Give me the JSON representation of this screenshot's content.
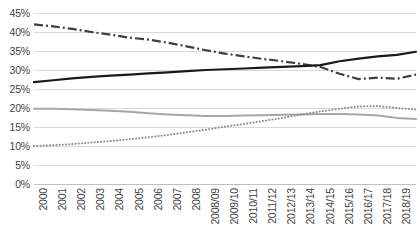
{
  "chart_data": {
    "type": "line",
    "title": "",
    "subtitle": "",
    "xlabel": "",
    "ylabel": "",
    "ylim": [
      0,
      45
    ],
    "y_tick_step": 5,
    "grid": true,
    "legend_position": "none",
    "categories": [
      "2000",
      "2001",
      "2002",
      "2003",
      "2004",
      "2005",
      "2006",
      "2007",
      "2008",
      "2008/09",
      "2009/10",
      "2010/11",
      "2011/12",
      "2012/13",
      "2013/14",
      "2014/15",
      "2015/16",
      "2016/17",
      "2017/18",
      "2018/19",
      "2019/20"
    ],
    "y_tick_labels": [
      "0%",
      "5%",
      "10%",
      "15%",
      "20%",
      "25%",
      "30%",
      "35%",
      "40%",
      "45%"
    ],
    "series": [
      {
        "name": "series-dash-dot",
        "style": "dash-dot",
        "color": "#3f3f3f",
        "width": 2.2,
        "values": [
          42.0,
          41.5,
          40.8,
          40.0,
          39.3,
          38.5,
          38.0,
          37.2,
          36.2,
          35.2,
          34.3,
          33.6,
          32.9,
          32.3,
          31.6,
          30.8,
          29.0,
          27.6,
          28.0,
          27.7,
          28.8
        ]
      },
      {
        "name": "series-solid-black",
        "style": "solid",
        "color": "#1a1a1a",
        "width": 2.2,
        "values": [
          26.8,
          27.3,
          27.8,
          28.2,
          28.5,
          28.8,
          29.1,
          29.4,
          29.7,
          30.0,
          30.2,
          30.4,
          30.6,
          30.8,
          31.0,
          31.3,
          32.3,
          33.0,
          33.6,
          34.0,
          34.8
        ]
      },
      {
        "name": "series-solid-gray",
        "style": "solid",
        "color": "#a6a6a6",
        "width": 2.0,
        "values": [
          19.8,
          19.8,
          19.7,
          19.5,
          19.3,
          19.0,
          18.6,
          18.3,
          18.1,
          17.9,
          17.9,
          18.0,
          18.1,
          18.2,
          18.3,
          18.4,
          18.4,
          18.3,
          18.0,
          17.4,
          17.1
        ]
      },
      {
        "name": "series-dotted-gray",
        "style": "dotted",
        "color": "#8c8c8c",
        "width": 2.0,
        "values": [
          10.0,
          10.2,
          10.5,
          10.9,
          11.3,
          11.8,
          12.3,
          12.9,
          13.6,
          14.3,
          15.1,
          15.8,
          16.6,
          17.4,
          18.3,
          19.1,
          19.8,
          20.4,
          20.5,
          20.0,
          19.6
        ]
      }
    ]
  },
  "artifact": {
    "top_sliver_text": "·"
  }
}
